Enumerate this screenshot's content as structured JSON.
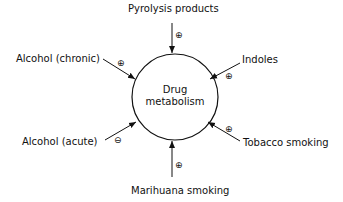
{
  "diagram": {
    "center": {
      "line1": "Drug",
      "line2": "metabolism"
    },
    "factors": [
      {
        "label": "Pyrolysis products",
        "effect": "⊕",
        "effect_name": "increase"
      },
      {
        "label": "Alcohol (chronic)",
        "effect": "⊕",
        "effect_name": "increase"
      },
      {
        "label": "Indoles",
        "effect": "⊕",
        "effect_name": "increase"
      },
      {
        "label": "Alcohol (acute)",
        "effect": "⊖",
        "effect_name": "decrease"
      },
      {
        "label": "Tobacco smoking",
        "effect": "⊕",
        "effect_name": "increase"
      },
      {
        "label": "Marihuana smoking",
        "effect": "⊕",
        "effect_name": "increase"
      }
    ],
    "colors": {
      "stroke": "#111111",
      "background": "#ffffff"
    }
  }
}
